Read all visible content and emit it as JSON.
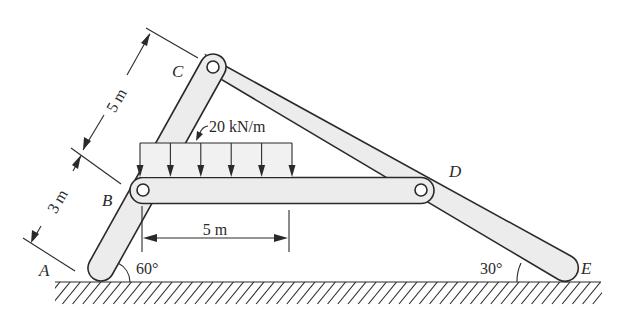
{
  "figure": {
    "points": {
      "A": "A",
      "B": "B",
      "C": "C",
      "D": "D",
      "E": "E"
    },
    "load": {
      "label": "20 kN/m",
      "magnitude": 20,
      "unit": "kN/m",
      "arrow_count": 6
    },
    "dimensions": {
      "AB": "3 m",
      "BC": "5 m",
      "load_length": "5 m"
    },
    "angles": {
      "at_A": "60°",
      "at_E": "30°"
    },
    "members": [
      {
        "name": "ABC",
        "from": "A",
        "to": "C",
        "pins": [
          "B",
          "C"
        ]
      },
      {
        "name": "BD",
        "from": "B",
        "to": "D",
        "pins": [
          "B",
          "D"
        ]
      },
      {
        "name": "CDE",
        "from": "C",
        "to": "E",
        "pins": [
          "C",
          "D"
        ]
      }
    ],
    "support": "ground"
  }
}
